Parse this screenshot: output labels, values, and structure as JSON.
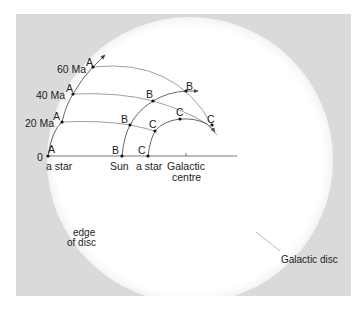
{
  "diagram": {
    "time_labels": [
      "0",
      "20 Ma",
      "40 Ma",
      "60 Ma"
    ],
    "point_labels": {
      "a": "A",
      "b": "B",
      "c": "C"
    },
    "baseline_labels": {
      "star_a": "a star",
      "sun": "Sun",
      "star_c": "a star",
      "galactic_centre_line1": "Galactic",
      "galactic_centre_line2": "centre"
    },
    "annotations": {
      "edge_line1": "edge",
      "edge_line2": "of disc",
      "galactic_disc": "Galactic disc"
    },
    "colors": {
      "background": "#dadada",
      "disc": "#ffffff",
      "line": "#555555",
      "text": "#222222"
    }
  }
}
